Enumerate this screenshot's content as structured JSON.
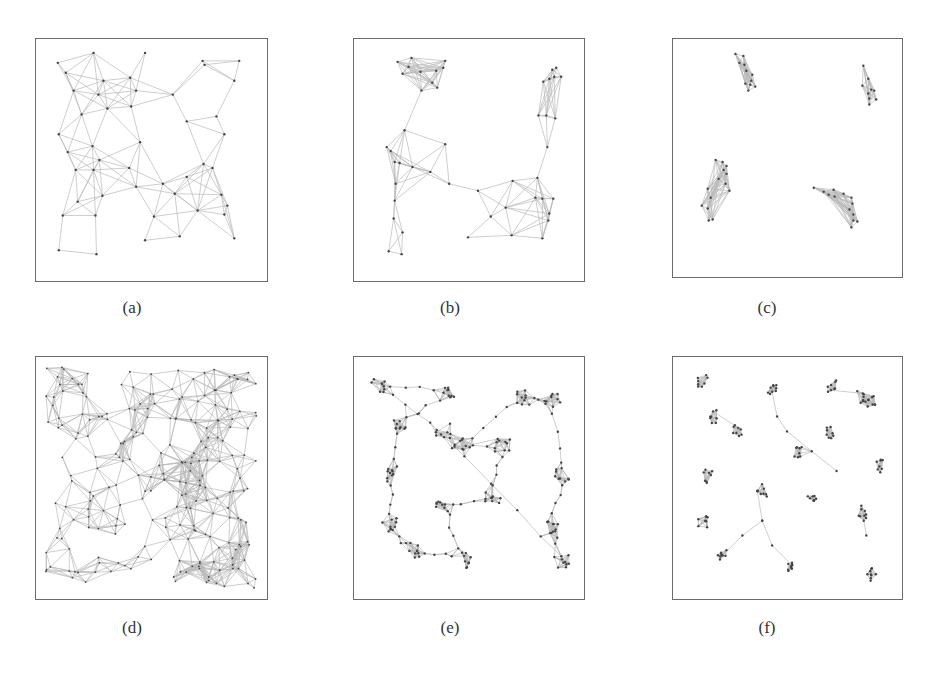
{
  "figure": {
    "panels": [
      {
        "id": "a",
        "caption": "(a)",
        "box": {
          "x": 35,
          "y": 38,
          "w": 233,
          "h": 244
        },
        "caption_pos": {
          "x": 122,
          "y": 298
        },
        "description": "Uniform-ish geometric graph with a large empty region in upper-middle",
        "nodes": [
          [
            22,
            24
          ],
          [
            58,
            14
          ],
          [
            110,
            14
          ],
          [
            168,
            22
          ],
          [
            205,
            22
          ],
          [
            30,
            34
          ],
          [
            38,
            52
          ],
          [
            68,
            42
          ],
          [
            95,
            39
          ],
          [
            101,
            52
          ],
          [
            63,
            56
          ],
          [
            138,
            56
          ],
          [
            170,
            26
          ],
          [
            200,
            42
          ],
          [
            46,
            76
          ],
          [
            72,
            70
          ],
          [
            96,
            68
          ],
          [
            152,
            83
          ],
          [
            182,
            78
          ],
          [
            190,
            96
          ],
          [
            105,
            104
          ],
          [
            23,
            96
          ],
          [
            57,
            108
          ],
          [
            64,
            122
          ],
          [
            32,
            114
          ],
          [
            40,
            132
          ],
          [
            58,
            132
          ],
          [
            94,
            130
          ],
          [
            169,
            126
          ],
          [
            178,
            130
          ],
          [
            128,
            146
          ],
          [
            152,
            139
          ],
          [
            101,
            149
          ],
          [
            140,
            156
          ],
          [
            187,
            157
          ],
          [
            193,
            168
          ],
          [
            42,
            164
          ],
          [
            67,
            158
          ],
          [
            190,
            177
          ],
          [
            27,
            178
          ],
          [
            60,
            178
          ],
          [
            163,
            173
          ],
          [
            119,
            179
          ],
          [
            110,
            203
          ],
          [
            145,
            199
          ],
          [
            200,
            201
          ],
          [
            23,
            213
          ],
          [
            61,
            217
          ]
        ]
      },
      {
        "id": "b",
        "caption": "(b)",
        "box": {
          "x": 353,
          "y": 38,
          "w": 232,
          "h": 244
        },
        "caption_pos": {
          "x": 440,
          "y": 298
        },
        "description": "Graph with a small isolated cluster upper-left, a cluster upper-right, and a connected U-shaped band",
        "nodes": [
          [
            44,
            23
          ],
          [
            58,
            19
          ],
          [
            55,
            28
          ],
          [
            49,
            35
          ],
          [
            67,
            33
          ],
          [
            83,
            32
          ],
          [
            90,
            29
          ],
          [
            92,
            22
          ],
          [
            79,
            44
          ],
          [
            84,
            49
          ],
          [
            68,
            52
          ],
          [
            200,
            31
          ],
          [
            204,
            29
          ],
          [
            197,
            40
          ],
          [
            202,
            38
          ],
          [
            209,
            38
          ],
          [
            191,
            43
          ],
          [
            186,
            77
          ],
          [
            194,
            77
          ],
          [
            203,
            80
          ],
          [
            195,
            109
          ],
          [
            51,
            92
          ],
          [
            92,
            106
          ],
          [
            33,
            109
          ],
          [
            37,
            113
          ],
          [
            41,
            124
          ],
          [
            46,
            125
          ],
          [
            59,
            129
          ],
          [
            77,
            134
          ],
          [
            96,
            146
          ],
          [
            42,
            146
          ],
          [
            41,
            163
          ],
          [
            40,
            181
          ],
          [
            49,
            195
          ],
          [
            35,
            214
          ],
          [
            48,
            217
          ],
          [
            125,
            153
          ],
          [
            160,
            143
          ],
          [
            185,
            140
          ],
          [
            183,
            160
          ],
          [
            201,
            161
          ],
          [
            190,
            161
          ],
          [
            197,
            176
          ],
          [
            196,
            183
          ],
          [
            153,
            170
          ],
          [
            138,
            179
          ],
          [
            159,
            198
          ],
          [
            190,
            201
          ],
          [
            115,
            200
          ]
        ]
      },
      {
        "id": "c",
        "caption": "(c)",
        "box": {
          "x": 672,
          "y": 38,
          "w": 231,
          "h": 240
        },
        "caption_pos": {
          "x": 757,
          "y": 298
        },
        "description": "Four isolated small clusters near corners",
        "nodes": [
          [
            63,
            15
          ],
          [
            71,
            17
          ],
          [
            67,
            24
          ],
          [
            72,
            26
          ],
          [
            74,
            32
          ],
          [
            80,
            36
          ],
          [
            79,
            42
          ],
          [
            73,
            45
          ],
          [
            78,
            46
          ],
          [
            83,
            48
          ],
          [
            76,
            52
          ],
          [
            192,
            27
          ],
          [
            197,
            40
          ],
          [
            191,
            47
          ],
          [
            200,
            51
          ],
          [
            197,
            55
          ],
          [
            203,
            52
          ],
          [
            205,
            61
          ],
          [
            198,
            60
          ],
          [
            198,
            66
          ],
          [
            43,
            122
          ],
          [
            50,
            124
          ],
          [
            51,
            132
          ],
          [
            54,
            128
          ],
          [
            54,
            136
          ],
          [
            46,
            141
          ],
          [
            53,
            146
          ],
          [
            57,
            153
          ],
          [
            35,
            151
          ],
          [
            38,
            160
          ],
          [
            29,
            168
          ],
          [
            35,
            171
          ],
          [
            36,
            183
          ],
          [
            40,
            182
          ],
          [
            142,
            150
          ],
          [
            152,
            154
          ],
          [
            157,
            157
          ],
          [
            162,
            152
          ],
          [
            163,
            159
          ],
          [
            172,
            156
          ],
          [
            180,
            160
          ],
          [
            181,
            166
          ],
          [
            178,
            172
          ],
          [
            182,
            177
          ],
          [
            182,
            183
          ],
          [
            186,
            184
          ],
          [
            180,
            190
          ]
        ]
      },
      {
        "id": "d",
        "caption": "(d)",
        "box": {
          "x": 35,
          "y": 356,
          "w": 233,
          "h": 244
        },
        "caption_pos": {
          "x": 122,
          "y": 618
        },
        "description": "Dense uniformly distributed random geometric graph",
        "nodes": "dense-uniform"
      },
      {
        "id": "e",
        "caption": "(e)",
        "box": {
          "x": 353,
          "y": 356,
          "w": 232,
          "h": 244
        },
        "caption_pos": {
          "x": 440,
          "y": 618
        },
        "description": "Graph with nodes clumped into dense hubs connected by filament-like chains",
        "nodes": "filament-clusters"
      },
      {
        "id": "f",
        "caption": "(f)",
        "box": {
          "x": 672,
          "y": 356,
          "w": 231,
          "h": 244
        },
        "caption_pos": {
          "x": 757,
          "y": 618
        },
        "description": "Many tiny isolated clusters plus a few connected chains",
        "nodes": "sparse-clusters"
      }
    ]
  }
}
